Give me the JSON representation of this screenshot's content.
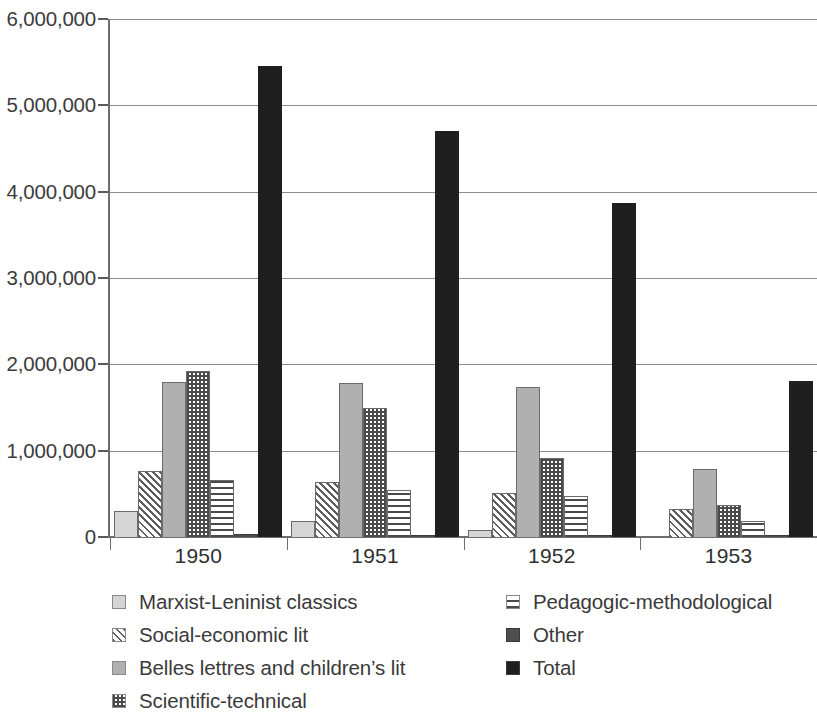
{
  "chart_data": {
    "type": "bar",
    "title": "",
    "subtitle": "",
    "xlabel": "",
    "ylabel": "",
    "categories": [
      "1950",
      "1951",
      "1952",
      "1953"
    ],
    "ylim": [
      0,
      6000000
    ],
    "yticks": [
      0,
      1000000,
      2000000,
      3000000,
      4000000,
      5000000,
      6000000
    ],
    "ytick_labels": [
      "0",
      "1,000,000",
      "2,000,000",
      "3,000,000",
      "4,000,000",
      "5,000,000",
      "6,000,000"
    ],
    "grid": true,
    "legend_position": "bottom",
    "series": [
      {
        "name": "Marxist-Leninist classics",
        "pattern": "light-solid",
        "color": "#d5d5d5",
        "values": [
          300000,
          180000,
          80000,
          0
        ]
      },
      {
        "name": "Social-economic lit",
        "pattern": "diagonal-hatch",
        "color": "#5e5e5e",
        "values": [
          770000,
          640000,
          510000,
          330000
        ]
      },
      {
        "name": "Belles lettres and children’s lit",
        "pattern": "mid-solid",
        "color": "#b0b0b0",
        "values": [
          1800000,
          1780000,
          1740000,
          790000
        ]
      },
      {
        "name": "Scientific-technical",
        "pattern": "checkered",
        "color": "#4a4a4a",
        "values": [
          1920000,
          1490000,
          910000,
          370000
        ]
      },
      {
        "name": "Pedagogic-methodological",
        "pattern": "horizontal-lines",
        "color": "#4a4a4a",
        "values": [
          660000,
          540000,
          470000,
          190000
        ]
      },
      {
        "name": "Other",
        "pattern": "dark-gray-solid",
        "color": "#4e4e4e",
        "values": [
          30000,
          20000,
          20000,
          20000
        ]
      },
      {
        "name": "Total",
        "pattern": "black-solid",
        "color": "#1f1f1f",
        "values": [
          5450000,
          4700000,
          3870000,
          1810000
        ]
      }
    ]
  },
  "legend": {
    "left_column": [
      {
        "label": "Marxist-Leninist classics",
        "swatch": "light-solid"
      },
      {
        "label": "Social-economic lit",
        "swatch": "diagonal-hatch"
      },
      {
        "label": "Belles lettres and children’s lit",
        "swatch": "mid-solid"
      },
      {
        "label": "Scientific-technical",
        "swatch": "checkered"
      }
    ],
    "right_column": [
      {
        "label": "Pedagogic-methodological",
        "swatch": "horizontal-lines"
      },
      {
        "label": "Other",
        "swatch": "dark-gray-solid"
      },
      {
        "label": "Total",
        "swatch": "black-solid"
      }
    ]
  }
}
